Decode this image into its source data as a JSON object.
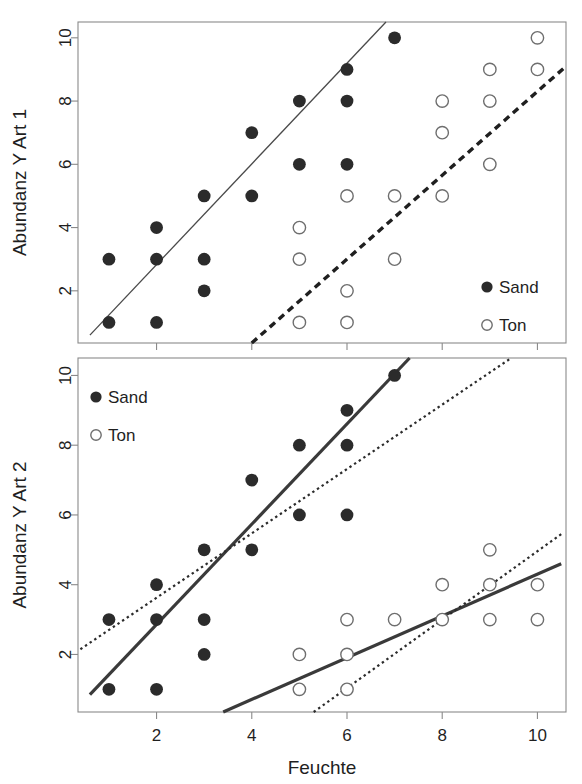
{
  "figure": {
    "width": 582,
    "height": 784,
    "background": "#ffffff",
    "xlabel": "Feuchte",
    "colors": {
      "sand_marker": "#2b2b2b",
      "ton_marker_stroke": "#6e6e6e",
      "frame": "#8a8a8a",
      "text": "#1f1f1f"
    }
  },
  "axes": {
    "x_ticks": [
      "2",
      "4",
      "6",
      "8",
      "10"
    ],
    "x_tick_values": [
      2,
      4,
      6,
      8,
      10
    ],
    "y_ticks": [
      "2",
      "4",
      "6",
      "8",
      "10"
    ],
    "y_tick_values": [
      2,
      4,
      6,
      8,
      10
    ],
    "xlim": [
      0.35,
      10.6
    ],
    "ylim_top": [
      0.35,
      10.5
    ],
    "ylim_bottom": [
      0.35,
      10.5
    ]
  },
  "legend": {
    "sand_label": "Sand",
    "ton_label": "Ton",
    "top_position": "bottom-right",
    "bottom_position": "top-left"
  },
  "chart_data": [
    {
      "type": "scatter",
      "panel": "top",
      "title": "",
      "xlabel": "",
      "ylabel": "Abundanz Y Art 1",
      "xlim": [
        0.35,
        10.6
      ],
      "ylim": [
        0.35,
        10.5
      ],
      "grid": false,
      "legend_position": "bottom-right",
      "series": [
        {
          "name": "Sand",
          "marker": "filled-circle",
          "x": [
            1,
            1,
            2,
            2,
            2,
            3,
            3,
            3,
            4,
            4,
            5,
            5,
            6,
            6,
            6,
            7
          ],
          "y": [
            1,
            3,
            1,
            3,
            4,
            2,
            3,
            5,
            5,
            7,
            6,
            8,
            6,
            8,
            9,
            10
          ]
        },
        {
          "name": "Ton",
          "marker": "open-circle",
          "x": [
            5,
            5,
            5,
            6,
            6,
            6,
            7,
            7,
            8,
            8,
            8,
            9,
            9,
            9,
            10,
            10
          ],
          "y": [
            1,
            3,
            4,
            1,
            2,
            5,
            3,
            5,
            5,
            7,
            8,
            6,
            8,
            9,
            9,
            10
          ]
        }
      ],
      "fit_lines": [
        {
          "name": "Sand regression",
          "style": "thin-solid",
          "x0": 0.6,
          "y0": 0.6,
          "x1": 6.85,
          "y1": 10.55
        },
        {
          "name": "Ton regression",
          "style": "thick-dashed",
          "x0": 4.0,
          "y0": 0.35,
          "x1": 10.6,
          "y1": 9.1
        }
      ]
    },
    {
      "type": "scatter",
      "panel": "bottom",
      "title": "",
      "xlabel": "Feuchte",
      "ylabel": "Abundanz Y Art 2",
      "xlim": [
        0.35,
        10.6
      ],
      "ylim": [
        0.35,
        10.5
      ],
      "grid": false,
      "legend_position": "top-left",
      "series": [
        {
          "name": "Sand",
          "marker": "filled-circle",
          "x": [
            1,
            1,
            2,
            2,
            2,
            3,
            3,
            3,
            4,
            4,
            5,
            5,
            6,
            6,
            6,
            7
          ],
          "y": [
            1,
            3,
            1,
            3,
            4,
            2,
            3,
            5,
            5,
            7,
            6,
            8,
            6,
            8,
            9,
            10
          ]
        },
        {
          "name": "Ton",
          "marker": "open-circle",
          "x": [
            5,
            5,
            6,
            6,
            6,
            7,
            8,
            8,
            9,
            9,
            9,
            10,
            10
          ],
          "y": [
            1,
            2,
            1,
            2,
            3,
            3,
            3,
            4,
            3,
            4,
            5,
            3,
            4
          ]
        }
      ],
      "fit_lines": [
        {
          "name": "Sand within-group regression",
          "style": "thick-solid",
          "x0": 0.6,
          "y0": 0.85,
          "x1": 7.35,
          "y1": 10.55
        },
        {
          "name": "Ton within-group regression",
          "style": "thick-solid",
          "x0": 3.4,
          "y0": 0.35,
          "x1": 10.5,
          "y1": 4.6
        },
        {
          "name": "Sand pooled regression",
          "style": "dotted",
          "x0": 0.4,
          "y0": 2.15,
          "x1": 9.45,
          "y1": 10.5
        },
        {
          "name": "Ton pooled regression",
          "style": "dotted",
          "x0": 5.3,
          "y0": 0.35,
          "x1": 10.5,
          "y1": 5.45
        }
      ]
    }
  ]
}
